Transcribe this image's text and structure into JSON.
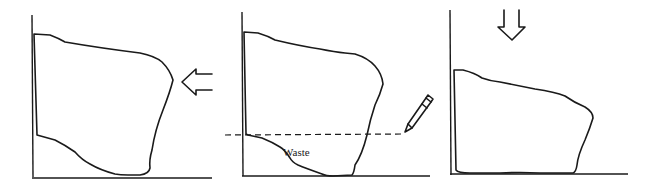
{
  "diagram": {
    "colors": {
      "ink": "#1a1a1a",
      "background": "#ffffff"
    },
    "panels": [
      {
        "id": "panel-1",
        "step": 1,
        "elements": [
          "corner-axes",
          "irregular-board",
          "push-left-arrow"
        ],
        "arrow_direction": "left"
      },
      {
        "id": "panel-2",
        "step": 2,
        "elements": [
          "corner-axes",
          "irregular-board",
          "scribe-dashed-line",
          "pencil",
          "waste-region"
        ],
        "waste_label": "Waste"
      },
      {
        "id": "panel-3",
        "step": 3,
        "elements": [
          "corner-axes",
          "trimmed-board",
          "push-down-arrow"
        ],
        "arrow_direction": "down"
      }
    ]
  }
}
